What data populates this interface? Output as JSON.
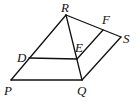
{
  "diagram": {
    "type": "geometry",
    "points": {
      "R": {
        "label": "R",
        "x": 66,
        "y": 15
      },
      "S": {
        "label": "S",
        "x": 121,
        "y": 37
      },
      "F": {
        "label": "F",
        "x": 103,
        "y": 30
      },
      "E": {
        "label": "E",
        "x": 77,
        "y": 58
      },
      "D": {
        "label": "D",
        "x": 29,
        "y": 58
      },
      "P": {
        "label": "P",
        "x": 11,
        "y": 80
      },
      "Q": {
        "label": "Q",
        "x": 82,
        "y": 80
      }
    },
    "segments": [
      "RS",
      "RP",
      "RQ",
      "PQ",
      "QS",
      "DE",
      "EF"
    ]
  }
}
